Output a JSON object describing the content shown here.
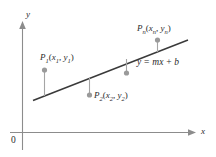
{
  "figure": {
    "background_color": "#ffffff",
    "line_color": "#3a3a3a",
    "axis_color": "#8c8c8c",
    "point_color": "#9a9a9a",
    "text_color": "#2b2b2b"
  },
  "axes": {
    "x_label": "x",
    "y_label": "y",
    "origin_label": "0"
  },
  "regression_line": {
    "equation_label_parts": {
      "y": "y",
      "equals": "=",
      "m": "m",
      "x": "x",
      "plus": "+",
      "b": "b"
    },
    "equation_label": "y = mx + b",
    "x_start": 33,
    "y_start": 100,
    "x_end": 188,
    "y_end": 40
  },
  "points": [
    {
      "id": "p1",
      "label_P": "P",
      "label_sub": "1",
      "label_args": "(x₁, y₁)",
      "dot_x": 44,
      "dot_y": 70,
      "stem_to_y": 93,
      "side": "above-line"
    },
    {
      "id": "p2",
      "label_P": "P",
      "label_sub": "2",
      "label_args": "(x₂, y₂)",
      "dot_x": 89,
      "dot_y": 95,
      "stem_to_y": 78,
      "side": "below-line"
    },
    {
      "id": "p-mid",
      "label_P": "",
      "label_sub": "",
      "label_args": "",
      "dot_x": 126,
      "dot_y": 73,
      "stem_to_y": 60,
      "side": "below-line"
    },
    {
      "id": "pn",
      "label_P": "P",
      "label_sub": "n",
      "label_args": "(xₙ, yₙ)",
      "dot_x": 157,
      "dot_y": 40,
      "stem_to_y": 51,
      "side": "above-line"
    }
  ],
  "labels": {
    "p1_P": "P",
    "p1_sub": "1",
    "p1_open": "(",
    "p1_x": "x",
    "p1_xsub": "1",
    "p1_comma": ", ",
    "p1_y": "y",
    "p1_ysub": "1",
    "p1_close": ")",
    "p2_P": "P",
    "p2_sub": "2",
    "p2_open": "(",
    "p2_x": "x",
    "p2_xsub": "2",
    "p2_comma": ", ",
    "p2_y": "y",
    "p2_ysub": "2",
    "p2_close": ")",
    "pn_P": "P",
    "pn_sub": "n",
    "pn_open": "(",
    "pn_x": "x",
    "pn_xsub": "n",
    "pn_comma": ", ",
    "pn_y": "y",
    "pn_ysub": "n",
    "pn_close": ")"
  }
}
